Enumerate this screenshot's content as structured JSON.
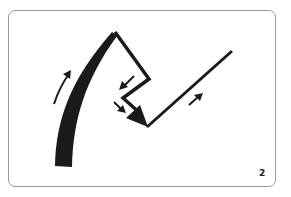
{
  "card": {
    "number": "2",
    "border_color": "#9a9a9a",
    "ink_color": "#1a1a1a"
  },
  "diagram": {
    "elements": [
      {
        "name": "thick-curved-stroke",
        "description": "thick tapering curve rising from bottom-left to apex"
      },
      {
        "name": "zigzag-path",
        "description": "line from apex down-right, back left, then down-right into arrowhead"
      },
      {
        "name": "diagonal-line",
        "description": "straight line from bottom vertex up-right"
      },
      {
        "name": "direction-arrow-up-curve",
        "description": "small curved arrow pointing up along left curve"
      },
      {
        "name": "direction-arrow-down-left",
        "description": "small arrow pointing down-left"
      },
      {
        "name": "direction-arrow-down-right",
        "description": "small arrow pointing down-right"
      },
      {
        "name": "direction-arrow-up-right",
        "description": "small arrow pointing up-right"
      }
    ]
  }
}
